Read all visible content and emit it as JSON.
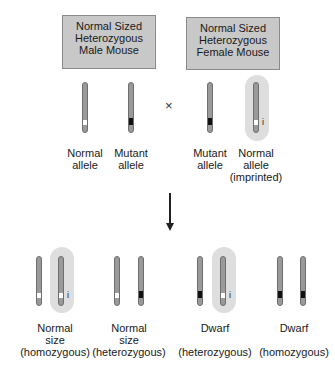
{
  "parents": [
    {
      "title_lines": [
        "Normal Sized",
        "Heterozygous",
        "Male Mouse"
      ],
      "alleles": [
        {
          "label_lines": [
            "Normal",
            "allele"
          ],
          "band": "white",
          "imprinted": false
        },
        {
          "label_lines": [
            "Mutant",
            "allele"
          ],
          "band": "black",
          "imprinted": false
        }
      ]
    },
    {
      "title_lines": [
        "Normal Sized",
        "Heterozygous",
        "Female Mouse"
      ],
      "alleles": [
        {
          "label_lines": [
            "Mutant",
            "allele"
          ],
          "band": "black",
          "imprinted": false
        },
        {
          "label_lines": [
            "Normal",
            "allele",
            "(imprinted)"
          ],
          "band": "white",
          "imprinted": true
        }
      ]
    }
  ],
  "cross_symbol": "×",
  "imprint_mark": "i",
  "offspring": [
    {
      "label_lines": [
        "Normal",
        "size",
        "(homozygous)"
      ],
      "alleles": [
        {
          "band": "white",
          "imprinted": false
        },
        {
          "band": "white",
          "imprinted": true
        }
      ]
    },
    {
      "label_lines": [
        "Normal",
        "size",
        "(heterozygous)"
      ],
      "alleles": [
        {
          "band": "white",
          "imprinted": false
        },
        {
          "band": "black",
          "imprinted": false
        }
      ]
    },
    {
      "label_lines": [
        "Dwarf",
        "",
        "(heterozygous)"
      ],
      "alleles": [
        {
          "band": "black",
          "imprinted": false
        },
        {
          "band": "white",
          "imprinted": true
        }
      ]
    },
    {
      "label_lines": [
        "Dwarf",
        "",
        "(homozygous)"
      ],
      "alleles": [
        {
          "band": "black",
          "imprinted": false
        },
        {
          "band": "black",
          "imprinted": false
        }
      ]
    }
  ],
  "colors": {
    "box_fill": "#c8c8c8",
    "chromosome": "#9a9a9a",
    "imprint_halo": "#dedede",
    "mutant_band": "#111111",
    "normal_band": "#ffffff"
  }
}
